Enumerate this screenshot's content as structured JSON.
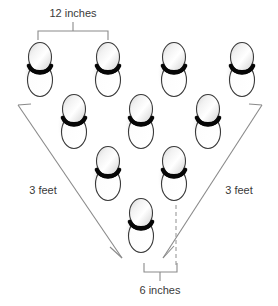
{
  "diagram": {
    "canvas": {
      "width": 278,
      "height": 306,
      "background": "#ffffff"
    },
    "labels": {
      "top_spacing": "12 inches",
      "bottom_spacing": "6 inches",
      "left_side": "3 feet",
      "right_side": "3 feet"
    },
    "colors": {
      "outline": "#3a3a3a",
      "line": "#8a8a8a",
      "text": "#3a3a3a",
      "bulb_highlight": "#ffffff",
      "bulb_shade": "#c9c9c9",
      "band_dark": "#000000",
      "background": "#ffffff"
    },
    "measurements": {
      "top_bracket": {
        "x1": 38,
        "x2": 108,
        "y": 31,
        "tick_height": 9,
        "label_y": 16
      },
      "bottom_bracket": {
        "x1": 144,
        "x2": 177,
        "y": 272,
        "tick_height": 9,
        "label_y": 290
      },
      "left_rule": {
        "x1": 18,
        "y1": 105,
        "x2": 122,
        "y2": 258,
        "label_x": 43,
        "label_y": 193
      },
      "right_rule": {
        "x1": 262,
        "y1": 105,
        "x2": 163,
        "y2": 258,
        "label_x": 239,
        "label_y": 193
      },
      "dashed_vertical": {
        "x": 176,
        "y1": 205,
        "y2": 266
      }
    },
    "plants": {
      "count": 10,
      "rows": [
        {
          "row": 1,
          "y": 68,
          "xs": [
            40,
            108,
            174,
            242
          ]
        },
        {
          "row": 2,
          "y": 120,
          "xs": [
            74,
            141,
            208
          ]
        },
        {
          "row": 3,
          "y": 172,
          "xs": [
            108,
            174
          ]
        },
        {
          "row": 4,
          "y": 224,
          "xs": [
            141
          ]
        }
      ]
    }
  }
}
